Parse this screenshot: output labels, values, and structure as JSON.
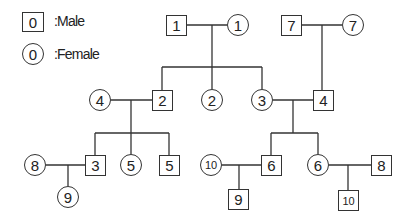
{
  "legend": {
    "male": {
      "symbol": "0",
      "label": ":Male",
      "shape": "square"
    },
    "female": {
      "symbol": "0",
      "label": ":Female",
      "shape": "circle"
    }
  },
  "pedigree": {
    "generation_1": [
      {
        "id": "m1",
        "sex": "male",
        "label": "1"
      },
      {
        "id": "f1",
        "sex": "female",
        "label": "1"
      },
      {
        "id": "m7",
        "sex": "male",
        "label": "7"
      },
      {
        "id": "f7",
        "sex": "female",
        "label": "7"
      }
    ],
    "generation_2": [
      {
        "id": "f4",
        "sex": "female",
        "label": "4"
      },
      {
        "id": "m2",
        "sex": "male",
        "label": "2"
      },
      {
        "id": "f2",
        "sex": "female",
        "label": "2"
      },
      {
        "id": "f3",
        "sex": "female",
        "label": "3"
      },
      {
        "id": "m4",
        "sex": "male",
        "label": "4"
      }
    ],
    "generation_3": [
      {
        "id": "f8",
        "sex": "female",
        "label": "8"
      },
      {
        "id": "m3",
        "sex": "male",
        "label": "3"
      },
      {
        "id": "f5",
        "sex": "female",
        "label": "5"
      },
      {
        "id": "m5",
        "sex": "male",
        "label": "5"
      },
      {
        "id": "f10",
        "sex": "female",
        "label": "10"
      },
      {
        "id": "m6",
        "sex": "male",
        "label": "6"
      },
      {
        "id": "f6",
        "sex": "female",
        "label": "6"
      },
      {
        "id": "m8",
        "sex": "male",
        "label": "8"
      }
    ],
    "generation_4": [
      {
        "id": "f9",
        "sex": "female",
        "label": "9"
      },
      {
        "id": "m9",
        "sex": "male",
        "label": "9"
      },
      {
        "id": "m10",
        "sex": "male",
        "label": "10"
      }
    ],
    "couples": [
      {
        "partners": [
          "m1",
          "f1"
        ],
        "children": [
          "m2",
          "f2",
          "f3"
        ]
      },
      {
        "partners": [
          "m7",
          "f7"
        ],
        "children": [
          "m4"
        ]
      },
      {
        "partners": [
          "f4",
          "m2"
        ],
        "children": [
          "m3",
          "f5",
          "m5"
        ]
      },
      {
        "partners": [
          "f3",
          "m4"
        ],
        "children": [
          "m6",
          "f6"
        ]
      },
      {
        "partners": [
          "f8",
          "m3"
        ],
        "children": [
          "f9"
        ]
      },
      {
        "partners": [
          "f10",
          "m6"
        ],
        "children": [
          "m9"
        ]
      },
      {
        "partners": [
          "f6",
          "m8"
        ],
        "children": [
          "m10"
        ]
      }
    ]
  },
  "colors": {
    "line": "#333333",
    "background": "#ffffff"
  }
}
